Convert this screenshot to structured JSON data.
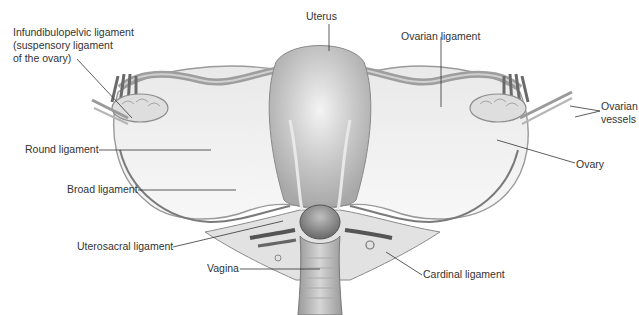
{
  "figure": {
    "colors": {
      "background": "#ffffff",
      "tissue_light": "#f2f2f2",
      "tissue_mid": "#c8c8c8",
      "tissue_dark": "#8a8a8a",
      "vessel_dark": "#5a5a5a",
      "label_text": "#333333",
      "leader_line": "#333333"
    }
  },
  "labels": {
    "uterus": "Uterus",
    "infundibulopelvic_line1": "Infundibulopelvic ligament",
    "infundibulopelvic_line2": "(suspensory ligament",
    "infundibulopelvic_line3": "of the ovary)",
    "ovarian_ligament": "Ovarian ligament",
    "ovarian_vessels_line1": "Ovarian",
    "ovarian_vessels_line2": "vessels",
    "round_ligament": "Round ligament",
    "ovary": "Ovary",
    "broad_ligament": "Broad ligament",
    "uterosacral_ligament": "Uterosacral ligament",
    "vagina": "Vagina",
    "cardinal_ligament": "Cardinal ligament"
  }
}
